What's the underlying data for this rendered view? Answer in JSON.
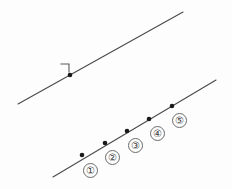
{
  "figure": {
    "canvas": {
      "width": 232,
      "height": 189
    },
    "colors": {
      "background": "#fdfdfd",
      "line": "#4a4a4a",
      "point": "#1a1a1a",
      "label_text": "#3a3a3a",
      "label_border": "#6b6b6b"
    },
    "upper_line": {
      "name": "upper-line",
      "x1": 18,
      "y1": 104,
      "x2": 183,
      "y2": 12,
      "point": {
        "name": "upper-line-point",
        "x": 70,
        "y": 75
      },
      "right_angle_mark": {
        "name": "right-angle-mark",
        "corner_x": 69,
        "corner_y": 64,
        "left_x": 61,
        "left_y": 64,
        "down_x": 69,
        "down_y": 72
      }
    },
    "lower_line": {
      "name": "lower-line",
      "x1": 53,
      "y1": 177,
      "x2": 216,
      "y2": 80,
      "points": [
        {
          "label": "①",
          "name": "point-1",
          "x": 82,
          "y": 155,
          "label_x": 83,
          "label_y": 163
        },
        {
          "label": "②",
          "name": "point-2",
          "x": 105,
          "y": 143,
          "label_x": 105,
          "label_y": 150
        },
        {
          "label": "③",
          "name": "point-3",
          "x": 127,
          "y": 131,
          "label_x": 128,
          "label_y": 138
        },
        {
          "label": "④",
          "name": "point-4",
          "x": 149,
          "y": 119,
          "label_x": 150,
          "label_y": 126
        },
        {
          "label": "⑤",
          "name": "point-5",
          "x": 172,
          "y": 106,
          "label_x": 172,
          "label_y": 113
        }
      ]
    }
  }
}
